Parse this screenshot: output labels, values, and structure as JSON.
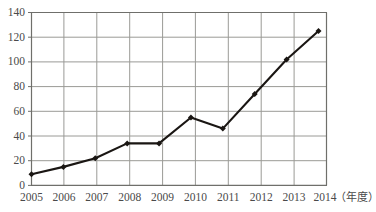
{
  "chart_data": {
    "type": "line",
    "title": "",
    "xlabel": "（年度）",
    "ylabel": "",
    "categories": [
      "2005",
      "2006",
      "2007",
      "2008",
      "2009",
      "2010",
      "2011",
      "2012",
      "2013",
      "2014"
    ],
    "values": [
      9,
      15,
      22,
      34,
      34,
      55,
      46,
      74,
      102,
      125
    ],
    "series": [
      {
        "name": "",
        "values": [
          9,
          15,
          22,
          34,
          34,
          55,
          46,
          74,
          102,
          125
        ]
      }
    ],
    "ylim": [
      0,
      140
    ],
    "yticks": [
      0,
      20,
      40,
      60,
      80,
      100,
      120,
      140
    ],
    "ytick_labels": [
      "0",
      "20",
      "40",
      "60",
      "80",
      "100",
      "120",
      "140"
    ],
    "xtick_labels": [
      "2005",
      "2006",
      "2007",
      "2008",
      "2009",
      "2010",
      "2011",
      "2012",
      "2013",
      "2014"
    ],
    "grid": true,
    "grid_x": true,
    "grid_y": true,
    "legend": false,
    "legend_position": "none",
    "marker": "diamond",
    "line_color": "#1a1613",
    "marker_color": "#1a1613",
    "grid_color": "#9a9a96",
    "axis_color": "#7d7d79",
    "tick_label_color": "#4a4a4a",
    "background_color": "#ffffff",
    "annotations": []
  }
}
